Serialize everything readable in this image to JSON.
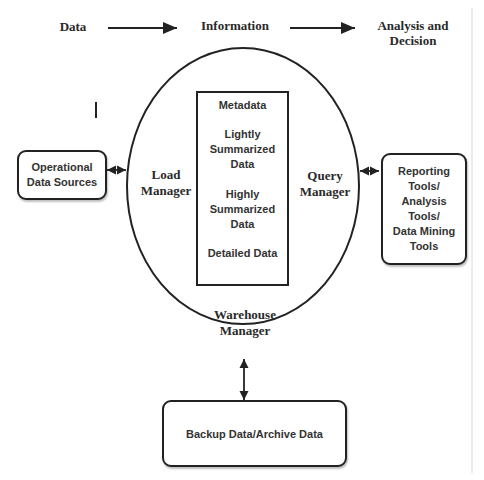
{
  "flow_header": {
    "step1": "Data",
    "step2": "Information",
    "step3_line1": "Analysis and",
    "step3_line2": "Decision"
  },
  "warehouse": {
    "load_manager_line1": "Load",
    "load_manager_line2": "Manager",
    "query_manager_line1": "Query",
    "query_manager_line2": "Manager",
    "warehouse_manager_line1": "Warehouse",
    "warehouse_manager_line2": "Manager",
    "storage": {
      "metadata": "Metadata",
      "lightly_line1": "Lightly",
      "lightly_line2": "Summarized",
      "lightly_line3": "Data",
      "highly_line1": "Highly",
      "highly_line2": "Summarized",
      "highly_line3": "Data",
      "detailed": "Detailed Data"
    }
  },
  "operational_sources": {
    "line1": "Operational",
    "line2": "Data Sources"
  },
  "tools": {
    "line1": "Reporting",
    "line2": "Tools/",
    "line3": "Analysis",
    "line4": "Tools/",
    "line5": "Data Mining",
    "line6": "Tools"
  },
  "backup": {
    "label": "Backup Data/Archive Data"
  },
  "stray_mark": "I"
}
